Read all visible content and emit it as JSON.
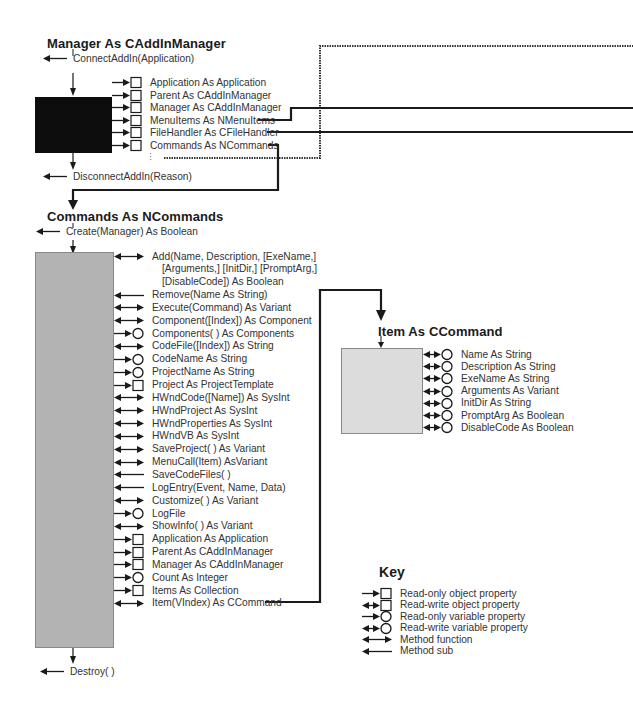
{
  "manager": {
    "title": "Manager As CAddInManager",
    "connect": "ConnectAddIn(Application)",
    "disconnect": "DisconnectAddIn(Reason)",
    "members": [
      {
        "kind": "ro-object",
        "label": "Application As Application"
      },
      {
        "kind": "ro-object",
        "label": "Parent As CAddInManager"
      },
      {
        "kind": "ro-object",
        "label": "Manager As CAddInManager"
      },
      {
        "kind": "ro-object",
        "label": "MenuItems As NMenuItems"
      },
      {
        "kind": "ro-object",
        "label": "FileHandler As CFileHandler"
      },
      {
        "kind": "ro-object",
        "label": "Commands As NCommands"
      }
    ],
    "ellipsis": "⋮"
  },
  "commands": {
    "title": "Commands As NCommands",
    "create": "Create(Manager) As Boolean",
    "destroy": "Destroy( )",
    "members": [
      {
        "kind": "function",
        "label": "Add(Name, Description, [ExeName,]"
      },
      {
        "kind": "continuation",
        "label": "[Arguments,] [InitDir,] [PromptArg,]"
      },
      {
        "kind": "continuation",
        "label": "[DisableCode]) As Boolean"
      },
      {
        "kind": "sub",
        "label": "Remove(Name As String)"
      },
      {
        "kind": "function",
        "label": "Execute(Command) As Variant"
      },
      {
        "kind": "function",
        "label": "Component([Index]) As Component"
      },
      {
        "kind": "ro-variable",
        "label": "Components( ) As Components"
      },
      {
        "kind": "function",
        "label": "CodeFile([Index]) As String"
      },
      {
        "kind": "ro-variable",
        "label": "CodeName As String"
      },
      {
        "kind": "ro-variable",
        "label": "ProjectName As String"
      },
      {
        "kind": "ro-object",
        "label": "Project As ProjectTemplate"
      },
      {
        "kind": "function",
        "label": "HWndCode([Name]) As SysInt"
      },
      {
        "kind": "function",
        "label": "HWndProject As SysInt"
      },
      {
        "kind": "function",
        "label": "HWndProperties As SysInt"
      },
      {
        "kind": "function",
        "label": "HWndVB As SysInt"
      },
      {
        "kind": "function",
        "label": "SaveProject( ) As Variant"
      },
      {
        "kind": "function",
        "label": "MenuCall(Item) AsVariant"
      },
      {
        "kind": "sub",
        "label": "SaveCodeFiles( )"
      },
      {
        "kind": "sub",
        "label": "LogEntry(Event, Name, Data)"
      },
      {
        "kind": "function",
        "label": "Customize( ) As Variant"
      },
      {
        "kind": "ro-variable",
        "label": "LogFile"
      },
      {
        "kind": "function",
        "label": "ShowInfo( ) As Variant"
      },
      {
        "kind": "ro-object",
        "label": "Application As Application"
      },
      {
        "kind": "ro-object",
        "label": "Parent As CAddInManager"
      },
      {
        "kind": "ro-object",
        "label": "Manager As CAddInManager"
      },
      {
        "kind": "ro-variable",
        "label": "Count As Integer"
      },
      {
        "kind": "ro-object",
        "label": "Items As Collection"
      },
      {
        "kind": "function",
        "label": "Item(VIndex) As CCommand"
      }
    ]
  },
  "item": {
    "title": "Item As CCommand",
    "members": [
      {
        "kind": "rw-variable",
        "label": "Name As String"
      },
      {
        "kind": "rw-variable",
        "label": "Description As String"
      },
      {
        "kind": "rw-variable",
        "label": "ExeName As String"
      },
      {
        "kind": "rw-variable",
        "label": "Arguments As Variant"
      },
      {
        "kind": "rw-variable",
        "label": "InitDir As String"
      },
      {
        "kind": "rw-variable",
        "label": "PromptArg As Boolean"
      },
      {
        "kind": "rw-variable",
        "label": "DisableCode As Boolean"
      }
    ]
  },
  "key": {
    "title": "Key",
    "entries": [
      {
        "kind": "ro-object",
        "label": "Read-only object property"
      },
      {
        "kind": "rw-object",
        "label": "Read-write object property"
      },
      {
        "kind": "ro-variable",
        "label": "Read-only variable property"
      },
      {
        "kind": "rw-variable",
        "label": "Read-write variable property"
      },
      {
        "kind": "function",
        "label": "Method function"
      },
      {
        "kind": "sub",
        "label": "Method sub"
      }
    ]
  },
  "colors": {
    "manager_box": "#0d0d0d",
    "commands_box": "#b3b3b3",
    "item_box": "#dcdcdc",
    "lines": "#1a1a1a"
  }
}
